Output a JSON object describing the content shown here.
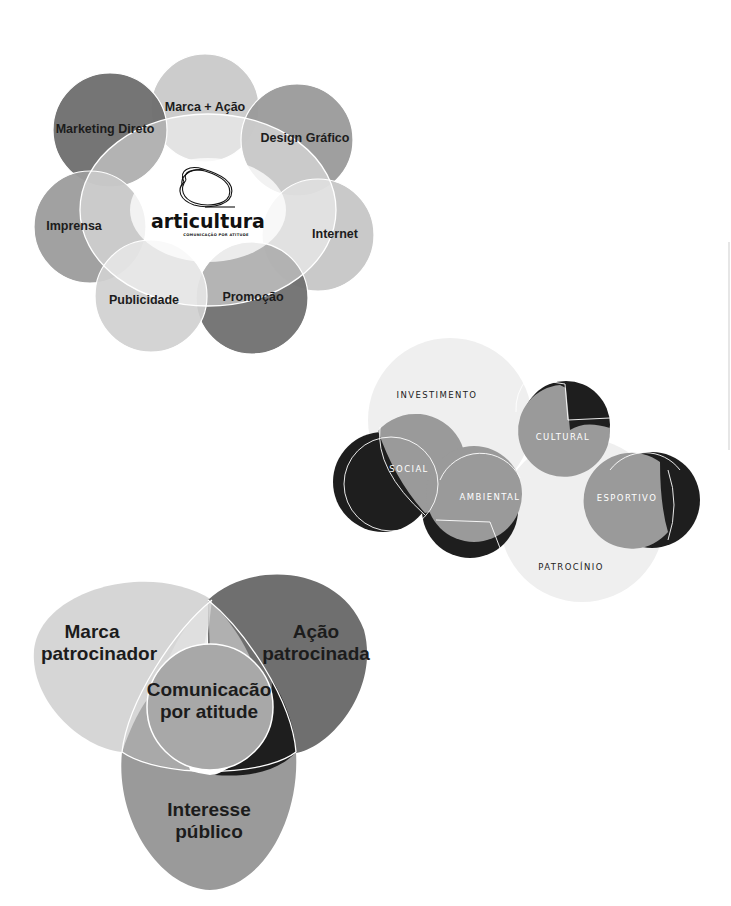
{
  "diagram1": {
    "title": "articultura services diagram",
    "logo": {
      "brand": "articultura",
      "tagline": "COMUNICAÇÃO POR ATITUDE"
    },
    "circles": [
      {
        "label": "Marca + Ação",
        "color": "#c9c9c9"
      },
      {
        "label": "Design Gráfico",
        "color": "#9a9a9a"
      },
      {
        "label": "Internet",
        "color": "#c4c4c4"
      },
      {
        "label": "Promoção",
        "color": "#707070"
      },
      {
        "label": "Publicidade",
        "color": "#d0d0d0"
      },
      {
        "label": "Imprensa",
        "color": "#9c9c9c"
      },
      {
        "label": "Marketing Direto",
        "color": "#6e6e6e"
      }
    ]
  },
  "diagram2": {
    "title": "Investimento / Patrocínio diagram",
    "large_circles": [
      {
        "label": "INVESTIMENTO",
        "color": "#efefef"
      },
      {
        "label": "PATROCÍNIO",
        "color": "#efefef"
      }
    ],
    "small_circles": [
      {
        "label": "SOCIAL",
        "color": "#9a9a9a"
      },
      {
        "label": "AMBIENTAL",
        "color": "#9a9a9a"
      },
      {
        "label": "CULTURAL",
        "color": "#9a9a9a"
      },
      {
        "label": "ESPORTIVO",
        "color": "#9a9a9a"
      }
    ],
    "shadow_color": "#1e1e1e"
  },
  "diagram3": {
    "title": "Comunicação por atitude Venn diagram",
    "lobes": [
      {
        "line1": "Marca",
        "line2": "patrocinador",
        "color": "#d6d6d6"
      },
      {
        "line1": "Ação",
        "line2": "patrocinada",
        "color": "#6f6f6f"
      },
      {
        "line1": "Interesse",
        "line2": "público",
        "color": "#9a9a9a"
      }
    ],
    "center": {
      "line1": "Comunicacão",
      "line2": "por atitude",
      "color": "#a8a8a8"
    },
    "shadow_color": "#1e1e1e"
  }
}
